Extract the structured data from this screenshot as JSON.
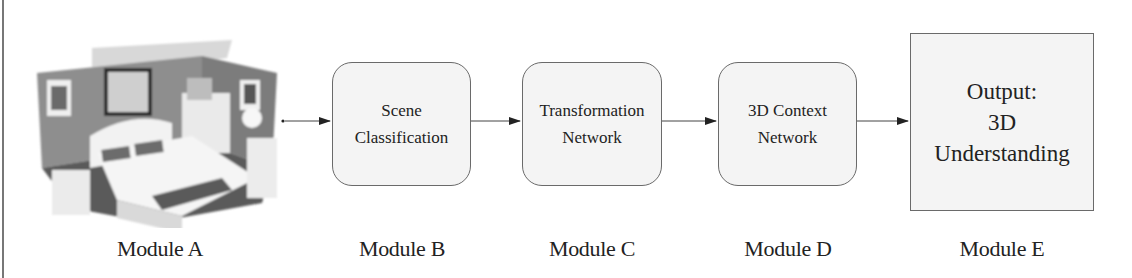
{
  "diagram": {
    "type": "pipeline-flowchart",
    "modules": [
      {
        "id": "A",
        "label": "Module A",
        "content": "3D bedroom scene (point cloud rendering)",
        "shape": "image"
      },
      {
        "id": "B",
        "label": "Module B",
        "lines": [
          "Scene",
          "Classification"
        ],
        "shape": "rounded-rect"
      },
      {
        "id": "C",
        "label": "Module C",
        "lines": [
          "Transformation",
          "Network"
        ],
        "shape": "rounded-rect"
      },
      {
        "id": "D",
        "label": "Module D",
        "lines": [
          "3D Context",
          "Network"
        ],
        "shape": "rounded-rect"
      },
      {
        "id": "E",
        "label": "Module E",
        "lines": [
          "Output:",
          "3D",
          "Understanding"
        ],
        "shape": "rect"
      }
    ],
    "edges": [
      {
        "from": "A",
        "to": "B"
      },
      {
        "from": "B",
        "to": "C"
      },
      {
        "from": "C",
        "to": "D"
      },
      {
        "from": "D",
        "to": "E"
      }
    ],
    "colors": {
      "box_fill": "#f4f4f4",
      "box_border": "#6a6a6a",
      "arrow": "#222222",
      "text": "#222222"
    }
  }
}
